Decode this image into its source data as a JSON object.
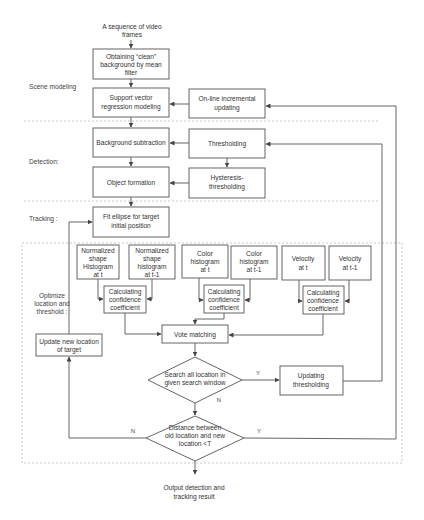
{
  "diagram": {
    "input_label": [
      "A sequence of video",
      "frames"
    ],
    "output_label": [
      "Output detection and",
      "tracking result"
    ],
    "sections": {
      "scene_modeling": "Scene modeling",
      "detection": "Detection:",
      "tracking": "Tracking :",
      "optimize": [
        "Optimize",
        "location and",
        "threshold :"
      ]
    },
    "nodes": {
      "mean_filter": [
        "Obtaining “clean”",
        "background by mean",
        "filter"
      ],
      "svr_modeling": [
        "Support vector",
        "regression modeling"
      ],
      "online_updating": [
        "On-line incremental",
        "updating"
      ],
      "bg_subtraction": [
        "Background subtraction"
      ],
      "thresholding": [
        "Thresholding"
      ],
      "object_formation": [
        "Object formation"
      ],
      "hysteresis": [
        "Hysteresis-",
        "thresholding"
      ],
      "fit_ellipse": [
        "Fit ellipse for target",
        "initial position"
      ],
      "shape_t": [
        "Normalized",
        "shape",
        "Histogram",
        "at t"
      ],
      "shape_t1": [
        "Normalized",
        "shape",
        "histogram",
        "at t-1"
      ],
      "color_t": [
        "Color",
        "histogram",
        "at t"
      ],
      "color_t1": [
        "Color",
        "histogram",
        "at t-1"
      ],
      "velocity_t": [
        "Velocity",
        "at t"
      ],
      "velocity_t1": [
        "Velocity",
        "at t-1"
      ],
      "conf_shape": [
        "Calculating",
        "confidence",
        "coefficient"
      ],
      "conf_color": [
        "Calculating",
        "confidence",
        "coefficient"
      ],
      "conf_velocity": [
        "Calculating",
        "confidence",
        "coefficient"
      ],
      "vote_matching": [
        "Vote matching"
      ],
      "search_decision": [
        "Search all location in",
        "given search window"
      ],
      "updating_thresholding": [
        "Updating",
        "thresholding"
      ],
      "distance_decision": [
        "Distance between",
        "old location and new",
        "location <T"
      ],
      "update_location": [
        "Update new location",
        "of target"
      ]
    },
    "edge_labels": {
      "search_yes": "Y",
      "search_no": "N",
      "distance_yes": "Y",
      "distance_no": "N"
    }
  }
}
